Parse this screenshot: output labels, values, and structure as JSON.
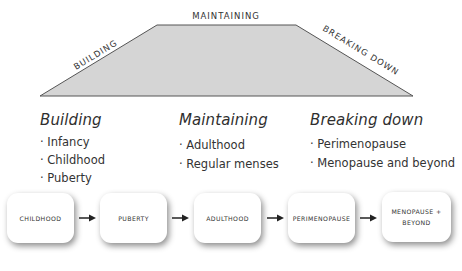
{
  "trapezoid": {
    "labels": {
      "left": "BUILDING",
      "top": "MAINTAINING",
      "right": "BREAKING DOWN"
    },
    "fill": "#d5d5d5",
    "stroke": "#555555"
  },
  "columns": [
    {
      "title": "Building",
      "items": [
        "Infancy",
        "Childhood",
        "Puberty"
      ]
    },
    {
      "title": "Maintaining",
      "items": [
        "Adulthood",
        "Regular menses"
      ]
    },
    {
      "title": "Breaking down",
      "items": [
        "Perimenopause",
        "Menopause and beyond"
      ]
    }
  ],
  "bullet": "·",
  "flow": [
    {
      "label": "CHILDHOOD"
    },
    {
      "label": "PUBERTY"
    },
    {
      "label": "ADULTHOOD"
    },
    {
      "label": "PERIMENOPAUSE"
    },
    {
      "label_line1": "MENOPAUSE +",
      "label_line2": "BEYOND"
    }
  ]
}
